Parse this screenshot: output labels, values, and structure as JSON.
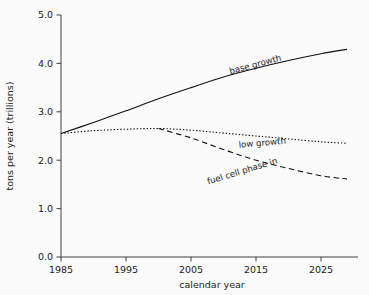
{
  "chart_data": {
    "type": "line",
    "title": "",
    "xlabel": "calendar year",
    "ylabel": "tons per year (trillions)",
    "xlim": [
      1985,
      2029
    ],
    "ylim": [
      0.0,
      5.0
    ],
    "grid": false,
    "legend_position": "inline-annotations",
    "xticks": [
      "1985",
      "1995",
      "2005",
      "2015",
      "2025"
    ],
    "xtick_values": [
      1985,
      1995,
      2005,
      2015,
      2025
    ],
    "yticks": [
      "0.0",
      "1.0",
      "2.0",
      "3.0",
      "4.0",
      "5.0"
    ],
    "ytick_values": [
      0.0,
      1.0,
      2.0,
      3.0,
      4.0,
      5.0
    ],
    "x": [
      1985,
      1990,
      1995,
      2000,
      2005,
      2010,
      2015,
      2020,
      2025,
      2029
    ],
    "series": [
      {
        "name": "base growth",
        "style": "solid",
        "label": "base growth",
        "values": [
          2.55,
          2.78,
          3.02,
          3.27,
          3.5,
          3.72,
          3.9,
          4.06,
          4.2,
          4.29
        ]
      },
      {
        "name": "low growth",
        "style": "dotted",
        "label": "low growth",
        "values": [
          2.55,
          2.61,
          2.64,
          2.655,
          2.62,
          2.56,
          2.5,
          2.44,
          2.38,
          2.35
        ]
      },
      {
        "name": "fuel cell phase in",
        "style": "dashed",
        "label": "fuel cell phase in",
        "values": [
          null,
          null,
          null,
          2.655,
          2.46,
          2.22,
          2.0,
          1.83,
          1.68,
          1.61
        ]
      }
    ],
    "annotations": [
      {
        "text": "base growth",
        "x": 2015,
        "y": 3.92,
        "rotation": -15
      },
      {
        "text": "low growth",
        "x": 2016,
        "y": 2.3,
        "rotation": -5
      },
      {
        "text": "fuel cell phase in",
        "x": 2013,
        "y": 1.72,
        "rotation": -17
      }
    ]
  }
}
